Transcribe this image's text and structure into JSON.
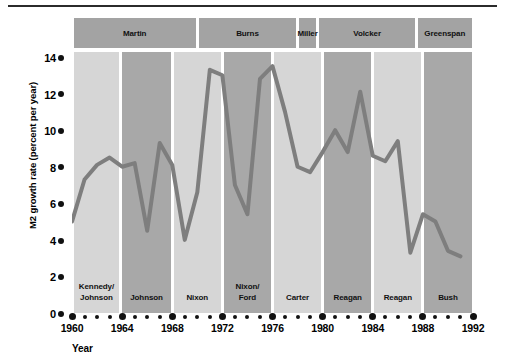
{
  "chart_data": {
    "type": "line",
    "title": "",
    "subtitle": "",
    "xlabel": "Year",
    "ylabel": "M2 growth rate (percent per year)",
    "xlim": [
      1960,
      1992
    ],
    "ylim": [
      0,
      14
    ],
    "ytick_values": [
      0,
      2,
      4,
      6,
      8,
      10,
      12,
      14
    ],
    "ytick_labels": [
      "0",
      "2",
      "4",
      "6",
      "8",
      "10",
      "12",
      "14"
    ],
    "xtick_values": [
      1960,
      1964,
      1968,
      1972,
      1976,
      1980,
      1984,
      1988,
      1992
    ],
    "xtick_labels": [
      "1960",
      "1964",
      "1968",
      "1972",
      "1976",
      "1980",
      "1984",
      "1988",
      "1992"
    ],
    "xtick_minor_step": 1,
    "grid": false,
    "legend": false,
    "line_color": "#7e7e7e",
    "line_width": 4,
    "series": [
      {
        "name": "M2 growth rate",
        "x": [
          1960,
          1961,
          1962,
          1963,
          1964,
          1965,
          1966,
          1967,
          1968,
          1969,
          1970,
          1971,
          1972,
          1973,
          1974,
          1975,
          1976,
          1977,
          1978,
          1979,
          1980,
          1981,
          1982,
          1983,
          1984,
          1985,
          1986,
          1987,
          1988,
          1989,
          1990,
          1991
        ],
        "values": [
          5.0,
          7.3,
          8.1,
          8.5,
          8.0,
          8.2,
          4.5,
          9.3,
          8.1,
          4.0,
          6.6,
          13.3,
          13.0,
          7.0,
          5.4,
          12.8,
          13.5,
          11.0,
          8.0,
          7.7,
          8.8,
          10.0,
          8.8,
          12.1,
          8.6,
          8.3,
          9.4,
          3.3,
          5.4,
          5.0,
          3.4,
          3.1
        ]
      }
    ],
    "fed_chair_bands": [
      {
        "label": "Martin",
        "start": 1960,
        "end": 1970
      },
      {
        "label": "Burns",
        "start": 1970,
        "end": 1978
      },
      {
        "label": "Miller",
        "start": 1978,
        "end": 1979.6
      },
      {
        "label": "Volcker",
        "start": 1979.6,
        "end": 1987.5
      },
      {
        "label": "Greenspan",
        "start": 1987.5,
        "end": 1992
      }
    ],
    "president_bands": [
      {
        "label": "Kennedy/\nJohnson",
        "start": 1960,
        "end": 1963.9,
        "shade": "light"
      },
      {
        "label": "Johnson",
        "start": 1963.9,
        "end": 1968,
        "shade": "dark"
      },
      {
        "label": "Nixon",
        "start": 1968,
        "end": 1972,
        "shade": "light"
      },
      {
        "label": "Nixon/\nFord",
        "start": 1972,
        "end": 1976,
        "shade": "dark"
      },
      {
        "label": "Carter",
        "start": 1976,
        "end": 1980,
        "shade": "light"
      },
      {
        "label": "Reagan",
        "start": 1980,
        "end": 1984,
        "shade": "dark"
      },
      {
        "label": "Reagan",
        "start": 1984,
        "end": 1988,
        "shade": "light"
      },
      {
        "label": "Bush",
        "start": 1988,
        "end": 1992,
        "shade": "dark"
      }
    ],
    "colors": {
      "band_light": "#d6d6d6",
      "band_dark": "#a8a8a8",
      "fed_band": "#a3a3a3",
      "line": "#7e7e7e",
      "text": "#111111",
      "background": "#ffffff"
    }
  }
}
